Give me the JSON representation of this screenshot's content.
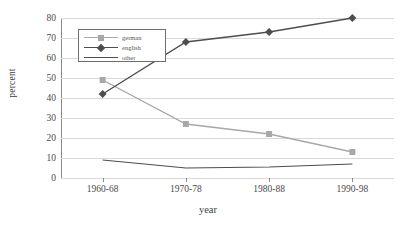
{
  "chart_data": {
    "type": "line",
    "title": "",
    "xlabel": "year",
    "ylabel": "percent",
    "categories": [
      "1960-68",
      "1970-78",
      "1980-88",
      "1990-98"
    ],
    "series": [
      {
        "name": "german",
        "values": [
          49,
          27,
          22,
          13
        ],
        "color": "#a8a8a8",
        "marker": "square"
      },
      {
        "name": "english",
        "values": [
          42,
          68,
          73,
          80
        ],
        "color": "#4d4d4d",
        "marker": "diamond"
      },
      {
        "name": "other",
        "values": [
          9,
          5,
          5.5,
          7
        ],
        "color": "#4d4d4d",
        "marker": "none"
      }
    ],
    "ylim": [
      0,
      80
    ],
    "ytick_step": 10,
    "yticks": [
      0,
      10,
      20,
      30,
      40,
      50,
      60,
      70,
      80
    ],
    "grid": "horizontal",
    "legend_position": "top-left-inside",
    "legend_entries": [
      "german",
      "english",
      "other"
    ]
  },
  "axis": {
    "y_title": "percent",
    "x_title": "year"
  },
  "legend": {
    "items": [
      {
        "label": "german"
      },
      {
        "label": "english"
      },
      {
        "label": "other"
      }
    ]
  },
  "colors": {
    "german": "#a8a8a8",
    "english": "#4d4d4d",
    "other": "#4d4d4d",
    "gridline": "#d9d9d9",
    "axis": "#8a8a8a",
    "text": "#4a4a4a",
    "background": "#ffffff"
  }
}
